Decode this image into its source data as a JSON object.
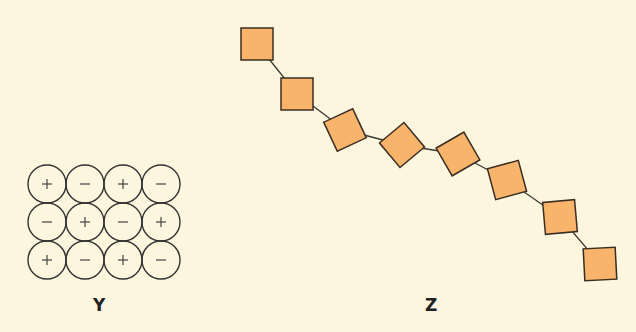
{
  "figure_y": {
    "label": "Y",
    "rows": [
      [
        "+",
        "−",
        "+",
        "−"
      ],
      [
        "−",
        "+",
        "−",
        "+"
      ],
      [
        "+",
        "−",
        "+",
        "−"
      ]
    ],
    "circle_stroke": "#333333"
  },
  "figure_z": {
    "label": "Z",
    "square_fill": "#f8b46a",
    "square_stroke": "#3a2e22",
    "squares": [
      {
        "cx": 257,
        "cy": 44,
        "rot": 0
      },
      {
        "cx": 297,
        "cy": 94,
        "rot": 0
      },
      {
        "cx": 345,
        "cy": 130,
        "rot": -25
      },
      {
        "cx": 402,
        "cy": 145,
        "rot": -40
      },
      {
        "cx": 458,
        "cy": 154,
        "rot": -30
      },
      {
        "cx": 507,
        "cy": 180,
        "rot": -15
      },
      {
        "cx": 560,
        "cy": 217,
        "rot": -5
      },
      {
        "cx": 600,
        "cy": 264,
        "rot": -3
      }
    ]
  },
  "colors": {
    "background": "#fdf6df"
  }
}
